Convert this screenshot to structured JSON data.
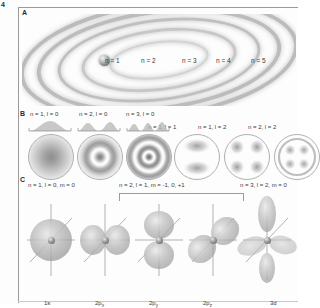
{
  "figure": {
    "number": "4",
    "sections": {
      "a": "A",
      "b": "B",
      "c": "C"
    }
  },
  "panel_a": {
    "caption": "Bohr orbits",
    "nucleus_label": "nucleus",
    "shell_labels": [
      {
        "text": "n = 1",
        "n": 1
      },
      {
        "text": "n = 2",
        "n": 2
      },
      {
        "text": "n = 3",
        "n": 3
      },
      {
        "text": "n = 4",
        "n": 4
      },
      {
        "text": "n = 5",
        "n": 5
      }
    ]
  },
  "panel_b": {
    "caption": "electron probability densities",
    "cells": [
      {
        "label": "n = 1, l = 0",
        "n": 1,
        "l": 0,
        "nodes": 0
      },
      {
        "label": "n = 2, l = 0",
        "n": 2,
        "l": 0,
        "nodes": 1
      },
      {
        "label": "n = 3, l = 0",
        "n": 3,
        "l": 0,
        "nodes": 2
      },
      {
        "label": "n = 1, l = 1",
        "n": 1,
        "l": 1,
        "nodes": 0
      },
      {
        "label": "n = 1, l = 2",
        "n": 1,
        "l": 2,
        "nodes": 0
      },
      {
        "label": "n = 2, l = 2",
        "n": 2,
        "l": 2,
        "nodes": 1
      }
    ]
  },
  "panel_c": {
    "caption": "orbital shapes",
    "groups": [
      {
        "label": "n = 1, l = 0, m = 0",
        "bracketed": false
      },
      {
        "label": "n = 2, l = 1, m = -1, 0, +1",
        "bracketed": true
      },
      {
        "label": "n = 3, l = 2, m = 0",
        "bracketed": false
      }
    ],
    "orbitals": [
      {
        "name": "1s",
        "base": "1",
        "sub": "",
        "suffix": "s"
      },
      {
        "name": "2px",
        "base": "2",
        "suffix": "p",
        "sub": "x"
      },
      {
        "name": "2py",
        "base": "2",
        "suffix": "p",
        "sub": "y"
      },
      {
        "name": "2pz",
        "base": "2",
        "suffix": "p",
        "sub": "z"
      },
      {
        "name": "3d",
        "base": "3",
        "suffix": "d",
        "sub": ""
      }
    ]
  },
  "colors": {
    "ink": "#3b3b3b",
    "rule": "#9a9a9a",
    "cloud": "#9e9e9e",
    "background": "#fdfdfd"
  }
}
